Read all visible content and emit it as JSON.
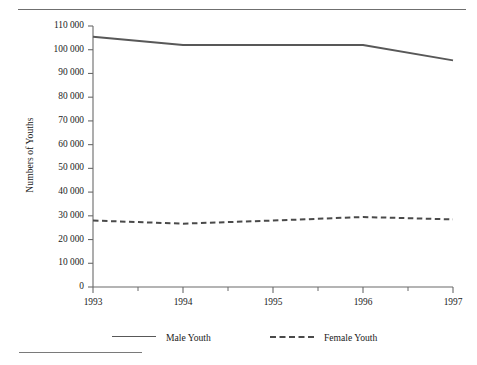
{
  "figure": {
    "y_axis_title": "Numbers of Youths",
    "top_rule": "horizontal-rule",
    "footnote_rule": "footnote-separator"
  },
  "legend": {
    "entries": [
      {
        "label": "Male Youth",
        "style": "solid",
        "color": "#585858"
      },
      {
        "label": "Female Youth",
        "style": "dashed",
        "color": "#4a4a4a"
      }
    ]
  },
  "chart_data": {
    "type": "line",
    "title": "",
    "xlabel": "",
    "ylabel": "Numbers of Youths",
    "x": [
      1993,
      1994,
      1995,
      1996,
      1997
    ],
    "categories": [
      "1993",
      "1994",
      "1995",
      "1996",
      "1997"
    ],
    "xlim": [
      1993,
      1997
    ],
    "ylim": [
      0,
      110000
    ],
    "ytick_labels": [
      "0",
      "10 000",
      "20 000",
      "30 000",
      "40 000",
      "50 000",
      "60 000",
      "70 000",
      "80 000",
      "90 000",
      "100 000",
      "110 000"
    ],
    "ytick_values": [
      0,
      10000,
      20000,
      30000,
      40000,
      50000,
      60000,
      70000,
      80000,
      90000,
      100000,
      110000
    ],
    "xtick_labels": [
      "1993",
      "1994",
      "1995",
      "1996",
      "1997"
    ],
    "minor_xticks": [
      1993.5,
      1994.5,
      1995.5,
      1996.5
    ],
    "grid": false,
    "legend_position": "bottom",
    "series": [
      {
        "name": "Male Youth",
        "style": "solid",
        "color": "#585858",
        "values": [
          105500,
          102000,
          102000,
          102000,
          95500
        ]
      },
      {
        "name": "Female Youth",
        "style": "dashed",
        "color": "#4a4a4a",
        "values": [
          28000,
          26700,
          28000,
          29500,
          28500
        ]
      }
    ]
  }
}
